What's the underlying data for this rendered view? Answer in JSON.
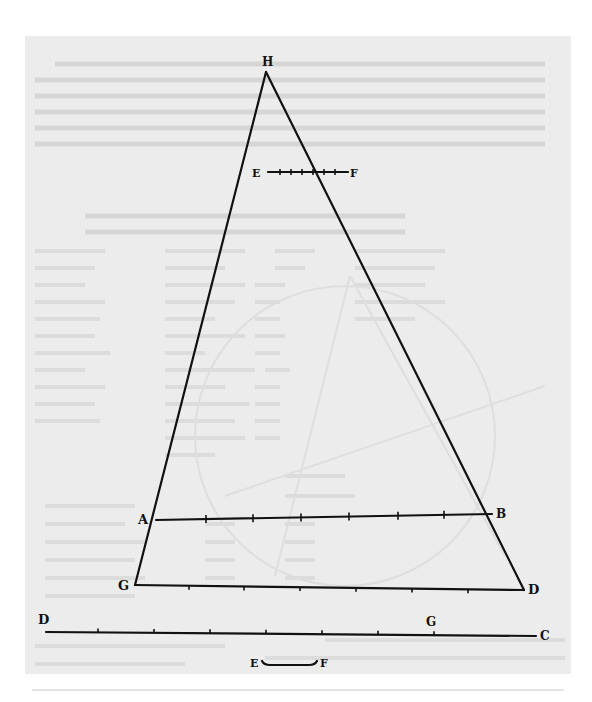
{
  "page": {
    "background": "#ffffff",
    "scan_tone": "#ececec",
    "ink": "#111111",
    "bleed_tone": "#d2d2d2"
  },
  "diagram": {
    "title": "",
    "points": {
      "H": {
        "label": "H",
        "x": 266,
        "y": 72
      },
      "E_top": {
        "label": "E",
        "x": 268,
        "y": 172
      },
      "F_top": {
        "label": "F",
        "x": 348,
        "y": 172
      },
      "A": {
        "label": "A",
        "x": 156,
        "y": 520
      },
      "B": {
        "label": "B",
        "x": 492,
        "y": 514
      },
      "G": {
        "label": "G",
        "x": 135,
        "y": 585
      },
      "D": {
        "label": "D",
        "x": 524,
        "y": 590
      },
      "D_line": {
        "label": "D",
        "x": 46,
        "y": 632
      },
      "G_line": {
        "label": "G",
        "x": 434,
        "y": 634
      },
      "C": {
        "label": "C",
        "x": 536,
        "y": 636
      },
      "E_small": {
        "label": "E",
        "x": 262,
        "y": 665
      },
      "F_small": {
        "label": "F",
        "x": 317,
        "y": 665
      }
    },
    "segments": [
      {
        "name": "HG",
        "from": "H",
        "to": "G"
      },
      {
        "name": "HD",
        "from": "H",
        "to": "D"
      },
      {
        "name": "EF",
        "from": "E_top",
        "to": "F_top"
      },
      {
        "name": "AB",
        "from": "A",
        "to": "B"
      },
      {
        "name": "GD",
        "from": "G",
        "to": "D"
      },
      {
        "name": "DC",
        "from": "D_line",
        "to": "C"
      },
      {
        "name": "EF-small",
        "from": "E_small",
        "to": "F_small"
      }
    ],
    "ticks": {
      "EF": [
        280,
        291,
        302,
        313,
        324,
        335
      ],
      "AB": [
        206,
        253,
        301,
        349,
        398,
        444
      ],
      "GD": [
        189,
        244,
        300,
        356,
        412,
        468
      ],
      "DC": [
        98,
        154,
        210,
        266,
        322,
        378,
        434
      ]
    },
    "labels": [
      {
        "text": "H",
        "x": 262,
        "y": 66,
        "size": 12
      },
      {
        "text": "E",
        "x": 252,
        "y": 177,
        "size": 11
      },
      {
        "text": "F",
        "x": 350,
        "y": 177,
        "size": 11
      },
      {
        "text": "A",
        "x": 138,
        "y": 524,
        "size": 13
      },
      {
        "text": "B",
        "x": 496,
        "y": 518,
        "size": 12
      },
      {
        "text": "G",
        "x": 118,
        "y": 590,
        "size": 13
      },
      {
        "text": "D",
        "x": 528,
        "y": 594,
        "size": 13
      },
      {
        "text": "D",
        "x": 38,
        "y": 624,
        "size": 13
      },
      {
        "text": "G",
        "x": 426,
        "y": 626,
        "size": 12
      },
      {
        "text": "C",
        "x": 540,
        "y": 640,
        "size": 12
      },
      {
        "text": "E",
        "x": 250,
        "y": 667,
        "size": 11
      },
      {
        "text": "F",
        "x": 320,
        "y": 667,
        "size": 11
      }
    ]
  }
}
